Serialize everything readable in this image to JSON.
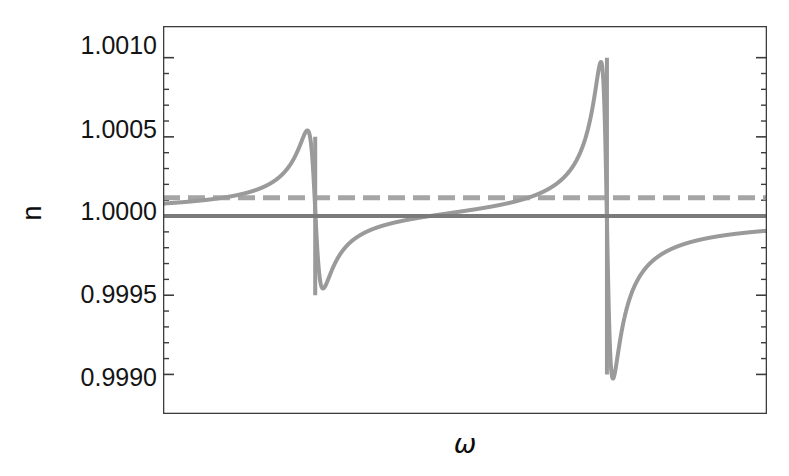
{
  "figure": {
    "background": "#ffffff",
    "frame_color": "#3d3d3d",
    "tick_color": "#3d3d3d"
  },
  "axes": {
    "ylabel": "n",
    "xlabel": "ω",
    "ytick_labels": [
      "1.0010",
      "1.0005",
      "1.0000",
      "0.9995",
      "0.9990"
    ],
    "ytick_values": [
      1.001,
      1.0005,
      1.0,
      0.9995,
      0.999
    ]
  },
  "chart_data": {
    "type": "line",
    "title": "",
    "xlabel": "ω",
    "ylabel": "n",
    "grid": false,
    "legend": "none",
    "xlim": [
      0,
      1
    ],
    "ylim": [
      0.99875,
      1.0012
    ],
    "yticks": [
      1.001,
      1.0005,
      1.0,
      0.9995,
      0.999
    ],
    "ytick_labels": [
      "1.0010",
      "1.0005",
      "1.0000",
      "0.9995",
      "0.9990"
    ],
    "yminor_ticks": [
      1.0009,
      1.0008,
      1.0007,
      1.0006,
      1.0004,
      1.0003,
      1.0002,
      1.0001,
      0.9999,
      0.9998,
      0.9997,
      0.9996,
      0.9994,
      0.9993,
      0.9992,
      0.9991
    ],
    "xticks": [],
    "xtick_labels": [],
    "series": [
      {
        "name": "refractive index n(ω)",
        "style": "solid",
        "color": "#9a9a9a",
        "width": 4,
        "description": "Anomalous-dispersion curve with two Lorentzian resonances; asymptotes to n = 1.0000 far from resonance.",
        "resonances": [
          {
            "x_frac": 0.252,
            "peak_value": 1.0005,
            "trough_value": 0.9995,
            "width_frac": 0.013
          },
          {
            "x_frac": 0.735,
            "peak_value": 1.001,
            "trough_value": 0.999,
            "width_frac": 0.01
          }
        ],
        "baseline": 1.0
      },
      {
        "name": "vacuum reference n = 1",
        "style": "solid",
        "color": "#7a7a7a",
        "width": 4,
        "constant_y": 1.0
      },
      {
        "name": "threshold line",
        "style": "dashed",
        "color": "#a5a5a5",
        "width": 5,
        "dash_px": [
          17,
          8
        ],
        "constant_y": 1.000115
      }
    ]
  }
}
